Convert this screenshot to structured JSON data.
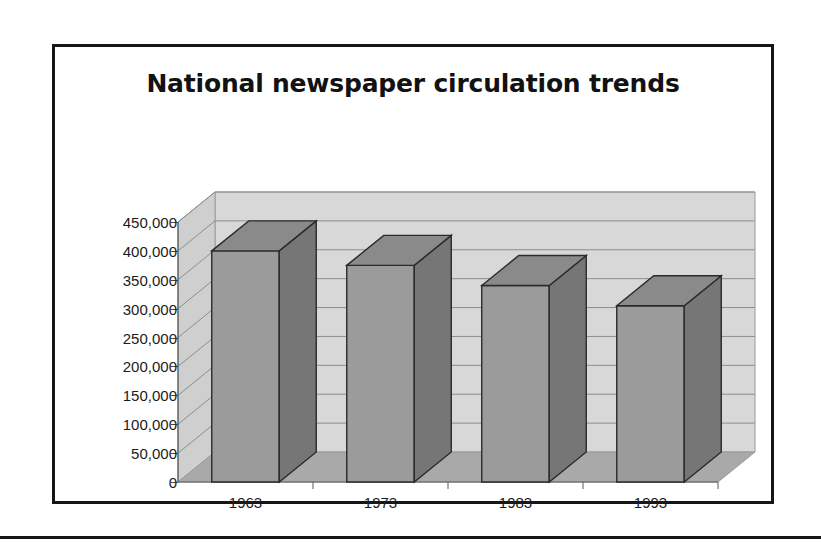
{
  "figure": {
    "title": "National newspaper circulation trends"
  },
  "chart_data": {
    "type": "bar",
    "title": "National newspaper circulation trends",
    "xlabel": "",
    "ylabel": "",
    "categories": [
      "1963",
      "1973",
      "1983",
      "1993"
    ],
    "values": [
      400000,
      375000,
      340000,
      305000
    ],
    "ylim": [
      0,
      450000
    ],
    "yticks": [
      0,
      50000,
      100000,
      150000,
      200000,
      250000,
      300000,
      350000,
      400000,
      450000
    ],
    "ytick_labels": [
      "0",
      "50,000",
      "100,000",
      "150,000",
      "200,000",
      "250,000",
      "300,000",
      "350,000",
      "400,000",
      "450,000"
    ],
    "grid": true,
    "legend": "none",
    "style": "3d-column",
    "colors": {
      "bar_front": "#9b9b9b",
      "bar_side": "#767676",
      "bar_top": "#8a8a8a",
      "bar_outline": "#2b2b2b",
      "wall_back": "#d8d8d8",
      "wall_side": "#cfcfcf",
      "floor": "#a9a9a9",
      "gridline": "#8d8d8d",
      "frame": "#161616",
      "text": "#1b1b1b"
    }
  }
}
